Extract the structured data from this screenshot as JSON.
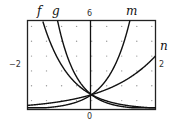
{
  "chart_data": {
    "type": "line",
    "title": "",
    "xlabel": "",
    "ylabel": "",
    "xlim": [
      -2,
      2
    ],
    "ylim": [
      0,
      6
    ],
    "grid": "dots",
    "x_tick_labels": {
      "left": "-2",
      "right": "2"
    },
    "y_tick_labels": {
      "top": "6",
      "bottom": "0"
    },
    "series": [
      {
        "name": "f",
        "base": 0.31,
        "kind": "exponential decay",
        "passes_through": [
          0,
          1
        ]
      },
      {
        "name": "g",
        "base": 0.185,
        "kind": "exponential decay",
        "passes_through": [
          0,
          1
        ]
      },
      {
        "name": "m",
        "base": 4.45,
        "kind": "exponential growth",
        "passes_through": [
          0,
          1
        ]
      },
      {
        "name": "n",
        "base": 1.9,
        "kind": "exponential growth",
        "passes_through": [
          0,
          1
        ]
      }
    ]
  },
  "labels": {
    "f": "f",
    "g": "g",
    "m": "m",
    "n": "n",
    "ytop": "6",
    "ybottom": "0",
    "xleft": "−2",
    "xright": "2"
  }
}
